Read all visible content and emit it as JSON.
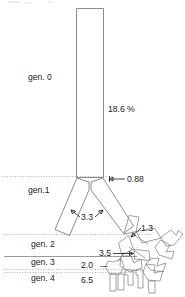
{
  "figure": {
    "background_color": "#ffffff",
    "tube_stroke_color": "#6e6e6e",
    "label_color": "#1c1c1c",
    "generation_line_color": "#8c8c8c"
  },
  "generation_labels": [
    {
      "id": "gen-0",
      "text": "gen. 0",
      "x": 28,
      "y": 80
    },
    {
      "id": "gen-1",
      "text": "gen.1",
      "x": 28,
      "y": 193
    },
    {
      "id": "gen-2",
      "text": "gen. 2",
      "x": 31,
      "y": 247
    },
    {
      "id": "gen-3",
      "text": "gen. 3",
      "x": 31,
      "y": 265
    },
    {
      "id": "gen-4",
      "text": "gen. 4",
      "x": 31,
      "y": 281
    }
  ],
  "dimension_labels": [
    {
      "id": "trunk-diameter",
      "text": "18.6 %",
      "x": 108,
      "y": 112
    },
    {
      "id": "gen1-diameter",
      "text": "0.88",
      "x": 129,
      "y": 182
    },
    {
      "id": "gen2-diameter",
      "text": "3.3",
      "x": 82,
      "y": 220
    },
    {
      "id": "gen2b-diameter",
      "text": "1.3",
      "x": 142,
      "y": 230
    },
    {
      "id": "gen3-diameter",
      "text": "3.5",
      "x": 101,
      "y": 255
    },
    {
      "id": "gen3b-diameter",
      "text": "2.0",
      "x": 82,
      "y": 268
    },
    {
      "id": "gen4-diameter",
      "text": "6.5",
      "x": 82,
      "y": 281
    }
  ],
  "generation_divider_lines": [
    {
      "id": "divider-gen1",
      "y": 176,
      "x1": 2,
      "x2": 113,
      "style": "dotted"
    },
    {
      "id": "divider-gen2",
      "y": 234,
      "x1": 4,
      "x2": 150,
      "style": "dotted"
    },
    {
      "id": "divider-gen3-upper",
      "y": 256,
      "x1": 4,
      "x2": 136,
      "style": "solid"
    },
    {
      "id": "divider-gen3-lower",
      "y": 269,
      "x1": 4,
      "x2": 136,
      "style": "dotted"
    },
    {
      "id": "divider-gen4",
      "y": 272,
      "x1": 4,
      "x2": 136,
      "style": "dotted"
    }
  ],
  "annotation_count": 7,
  "generation_count": 5
}
